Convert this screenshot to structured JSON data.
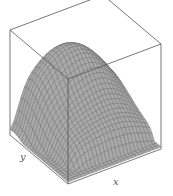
{
  "chart_data": {
    "type": "surface3d",
    "title": "",
    "xlabel": "x",
    "ylabel": "y",
    "zlabel": "",
    "tick_labels": [],
    "grid": "mesh lines on surface",
    "box": true,
    "colors": {
      "surface": "#a9a9a9",
      "mesh": "#6e6e6e",
      "box": "#555555"
    }
  },
  "labels": {
    "x": "x",
    "y": "y"
  }
}
